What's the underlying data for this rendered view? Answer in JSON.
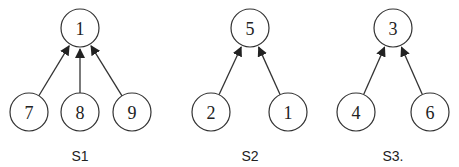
{
  "diagram": {
    "title": "",
    "node_radius": 19,
    "trees": [
      {
        "label": "S1",
        "label_pos": {
          "x": 80,
          "y": 161
        },
        "root": {
          "id": "1",
          "x": 80,
          "y": 28
        },
        "children": [
          {
            "id": "7",
            "x": 29,
            "y": 112
          },
          {
            "id": "8",
            "x": 80,
            "y": 112
          },
          {
            "id": "9",
            "x": 132,
            "y": 112
          }
        ]
      },
      {
        "label": "S2",
        "label_pos": {
          "x": 250,
          "y": 161
        },
        "root": {
          "id": "5",
          "x": 250,
          "y": 28
        },
        "children": [
          {
            "id": "2",
            "x": 211,
            "y": 112
          },
          {
            "id": "1",
            "x": 288,
            "y": 112
          }
        ]
      },
      {
        "label": "S3.",
        "label_pos": {
          "x": 393,
          "y": 161
        },
        "root": {
          "id": "3",
          "x": 393,
          "y": 28
        },
        "children": [
          {
            "id": "4",
            "x": 356,
            "y": 112
          },
          {
            "id": "6",
            "x": 430,
            "y": 112
          }
        ]
      }
    ],
    "edge_direction": "child-to-root",
    "colors": {
      "stroke": "#333333",
      "fill": "#ffffff",
      "text": "#222222"
    }
  }
}
